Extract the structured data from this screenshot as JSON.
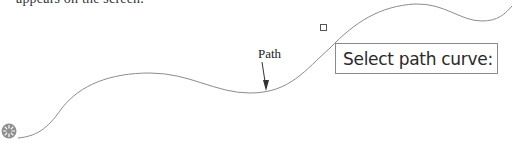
{
  "caption": {
    "partial_text": "appears on the screen."
  },
  "drawing": {
    "path_label": "Path",
    "curve_color": "#8c8c8c",
    "arrow_color": "#333333"
  },
  "command_prompt": {
    "text": "Select path curve:"
  },
  "cursor": {
    "type": "busy-icon"
  }
}
